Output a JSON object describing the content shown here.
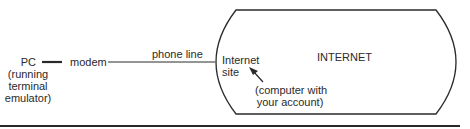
{
  "diagram": {
    "nodes": {
      "pc": {
        "line1": "PC",
        "line2": "(running",
        "line3": "terminal",
        "line4": "emulator)"
      },
      "modem": {
        "label": "modem"
      },
      "phone_line": {
        "label": "phone line"
      },
      "internet_site": {
        "line1": "Internet",
        "line2": "site"
      },
      "internet": {
        "label": "INTERNET"
      },
      "annotation": {
        "line1": "(computer with",
        "line2": "your account)"
      }
    },
    "edges": [
      {
        "from": "PC",
        "to": "modem",
        "style": "thick"
      },
      {
        "from": "modem",
        "to": "Internet site",
        "label": "phone line",
        "style": "thin"
      }
    ],
    "colors": {
      "stroke": "#2a2a2a",
      "background": "#ffffff"
    }
  }
}
